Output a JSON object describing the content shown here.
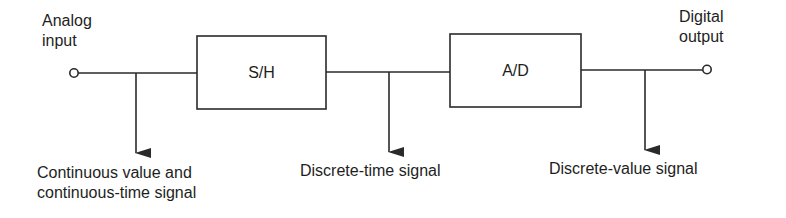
{
  "diagram": {
    "type": "block-diagram",
    "stroke_color": "#2a2a2a",
    "text_color": "#1e1e1e",
    "input": {
      "label_line1": "Analog",
      "label_line2": "input"
    },
    "output": {
      "label_line1": "Digital",
      "label_line2": "output"
    },
    "blocks": [
      {
        "id": "sample-hold",
        "label": "S/H"
      },
      {
        "id": "analog-to-digital",
        "label": "A/D"
      }
    ],
    "signals": [
      {
        "position": "after-input",
        "label_line1": "Continuous value and",
        "label_line2": "continuous-time signal"
      },
      {
        "position": "after-sample-hold",
        "label_line1": "Discrete-time signal"
      },
      {
        "position": "after-analog-to-digital",
        "label_line1": "Discrete-value signal"
      }
    ]
  }
}
